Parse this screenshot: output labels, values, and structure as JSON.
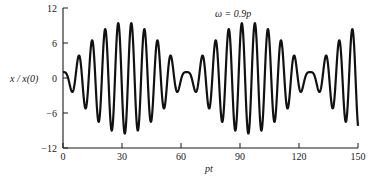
{
  "chart_data": {
    "type": "line",
    "title": "",
    "annotation": "ω = 0.9p",
    "xlabel": "pt",
    "ylabel": "x / x(0)",
    "xlim": [
      0,
      150
    ],
    "ylim": [
      -12,
      12
    ],
    "x_ticks": [
      0,
      30,
      60,
      90,
      120,
      150
    ],
    "x_tick_labels": [
      "0",
      "30",
      "60",
      "90",
      "120",
      "150"
    ],
    "y_ticks": [
      12,
      6,
      0,
      -6,
      -12
    ],
    "y_tick_labels": [
      "12",
      "6",
      "0",
      "−6",
      "−12"
    ],
    "grid": false,
    "legend": null,
    "series": [
      {
        "name": "x/x(0)",
        "description": "Undamped forced response, beat phenomenon with frequency ratio ω/p = 0.9",
        "formula": "x/x(0) = cos(pt) + (1/(1-r^2))*(cos(r*pt) - cos(pt)), r = 0.9",
        "color": "#111111",
        "envelope_peak": 11,
        "beat_nodes_pt": [
          0,
          63,
          126
        ]
      }
    ]
  },
  "labels": {
    "annotation": "ω = 0.9p",
    "xlabel": "pt",
    "ylabel": "x / x(0)"
  }
}
